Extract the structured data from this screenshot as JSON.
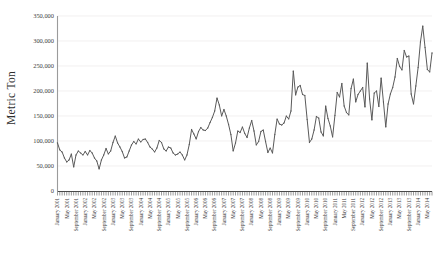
{
  "chart_data": {
    "type": "line",
    "title": "",
    "xlabel": "",
    "ylabel": "Metric Ton",
    "ylim": [
      0,
      350000
    ],
    "ytick_labels": [
      "350,000",
      "300,000",
      "250,000",
      "200,000",
      "150,000",
      "100,000",
      "50,000",
      "0"
    ],
    "ytick_values": [
      350000,
      300000,
      250000,
      200000,
      150000,
      100000,
      50000,
      0
    ],
    "grid": true,
    "legend": "none",
    "series_color": "#5a5a5a",
    "x_tick_labels": [
      "January 2001",
      "May 2001",
      "September 2001",
      "January 2002",
      "May 2002",
      "September 2002",
      "January 2003",
      "May 2003",
      "September 2003",
      "January 2004",
      "May 2004",
      "September 2004",
      "January 2005",
      "May 2005",
      "September 2005",
      "January 2006",
      "May 2006",
      "September 2006",
      "January 2007",
      "May 2007",
      "September 2007",
      "January 2008",
      "May 2008",
      "September 2008",
      "January 2009",
      "May 2009",
      "September 2009",
      "January 2010",
      "May 2010",
      "September 2010",
      "January 2011",
      "May 2011",
      "September 2011",
      "January 2012",
      "May 2012",
      "September 2012",
      "January 2013",
      "May 2013",
      "September 2013",
      "January 2014",
      "May 2014",
      "September 2014"
    ],
    "x_start": "January 2001",
    "x_end": "December 2014",
    "x_frequency": "monthly",
    "values": [
      96000,
      82000,
      78000,
      66000,
      58000,
      62000,
      74000,
      48000,
      72000,
      80000,
      76000,
      72000,
      79000,
      72000,
      81000,
      76000,
      66000,
      60000,
      44000,
      62000,
      72000,
      85000,
      74000,
      80000,
      97000,
      110000,
      96000,
      88000,
      79000,
      66000,
      68000,
      80000,
      92000,
      99000,
      94000,
      104000,
      98000,
      103000,
      104000,
      97000,
      88000,
      84000,
      78000,
      86000,
      101000,
      97000,
      84000,
      80000,
      88000,
      86000,
      76000,
      72000,
      74000,
      78000,
      72000,
      62000,
      72000,
      93000,
      123000,
      114000,
      104000,
      119000,
      127000,
      122000,
      121000,
      126000,
      137000,
      147000,
      160000,
      186000,
      172000,
      150000,
      163000,
      150000,
      133000,
      113000,
      80000,
      96000,
      120000,
      117000,
      128000,
      115000,
      107000,
      126000,
      141000,
      120000,
      92000,
      99000,
      119000,
      122000,
      99000,
      77000,
      86000,
      76000,
      113000,
      144000,
      134000,
      132000,
      136000,
      150000,
      144000,
      160000,
      240000,
      192000,
      208000,
      211000,
      193000,
      191000,
      143000,
      97000,
      104000,
      122000,
      149000,
      146000,
      118000,
      110000,
      170000,
      145000,
      130000,
      108000,
      151000,
      197000,
      188000,
      215000,
      170000,
      157000,
      152000,
      205000,
      224000,
      178000,
      193000,
      200000,
      207000,
      168000,
      256000,
      184000,
      142000,
      196000,
      200000,
      169000,
      226000,
      178000,
      128000,
      174000,
      194000,
      207000,
      228000,
      265000,
      249000,
      242000,
      281000,
      268000,
      270000,
      194000,
      174000,
      210000,
      247000,
      298000,
      330000,
      287000,
      243000,
      238000,
      276000
    ]
  }
}
